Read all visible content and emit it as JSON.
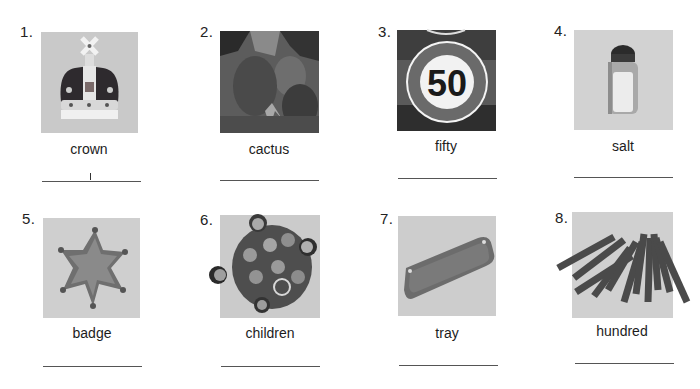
{
  "worksheet": {
    "items": [
      {
        "number": "1.",
        "word": "crown",
        "picture": "crown-photo",
        "answer": "l"
      },
      {
        "number": "2.",
        "word": "cactus",
        "picture": "cactus-photo",
        "answer": ""
      },
      {
        "number": "3.",
        "word": "fifty",
        "picture": "speed-limit-sign-photo",
        "sign_text": "50",
        "answer": ""
      },
      {
        "number": "4.",
        "word": "salt",
        "picture": "salt-shaker-photo",
        "answer": ""
      },
      {
        "number": "5.",
        "word": "badge",
        "picture": "sheriff-badge-photo",
        "answer": ""
      },
      {
        "number": "6.",
        "word": "children",
        "picture": "children-group-photo",
        "answer": ""
      },
      {
        "number": "7.",
        "word": "tray",
        "picture": "tray-photo",
        "answer": ""
      },
      {
        "number": "8.",
        "word": "hundred",
        "picture": "hundred-rods-photo",
        "answer": ""
      }
    ]
  },
  "colors": {
    "image_bg": "#cdcdcd",
    "line": "#555555",
    "text": "#1c1c1c"
  }
}
